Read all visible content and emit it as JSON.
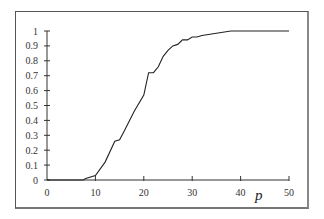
{
  "chart_data": {
    "type": "line",
    "title": "",
    "xlabel": "p",
    "ylabel": "",
    "xlim": [
      0,
      50
    ],
    "ylim": [
      0,
      1
    ],
    "grid": false,
    "legend": null,
    "x_ticks": [
      "0",
      "10",
      "20",
      "30",
      "40",
      "50"
    ],
    "y_ticks": [
      "0",
      "0.1",
      "0.2",
      "0.3",
      "0.4",
      "0.5",
      "0.6",
      "0.7",
      "0.8",
      "0.9",
      "1"
    ],
    "series": [
      {
        "name": "curve",
        "color": "#222222",
        "x": [
          0,
          7.5,
          8,
          10,
          12,
          14,
          15,
          16,
          18,
          20,
          21,
          22,
          23,
          24,
          25,
          26,
          27,
          28,
          29,
          30,
          31,
          32,
          34,
          36,
          38,
          50
        ],
        "values": [
          0,
          0,
          0.01,
          0.03,
          0.12,
          0.26,
          0.27,
          0.33,
          0.46,
          0.57,
          0.72,
          0.72,
          0.76,
          0.83,
          0.87,
          0.9,
          0.91,
          0.94,
          0.94,
          0.96,
          0.96,
          0.97,
          0.98,
          0.99,
          1.0,
          1.0
        ]
      }
    ]
  }
}
